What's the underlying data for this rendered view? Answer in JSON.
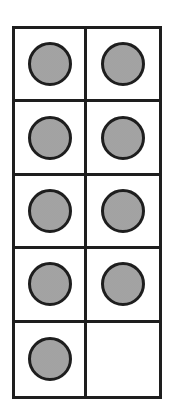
{
  "ten_frame": {
    "columns": 2,
    "rows": 5,
    "filled_count": 9,
    "total_cells": 10,
    "counter_color": "#a9a9a9",
    "line_color": "#1e1e1e",
    "cells": [
      {
        "row": 0,
        "col": 0,
        "filled": true
      },
      {
        "row": 0,
        "col": 1,
        "filled": true
      },
      {
        "row": 1,
        "col": 0,
        "filled": true
      },
      {
        "row": 1,
        "col": 1,
        "filled": true
      },
      {
        "row": 2,
        "col": 0,
        "filled": true
      },
      {
        "row": 2,
        "col": 1,
        "filled": true
      },
      {
        "row": 3,
        "col": 0,
        "filled": true
      },
      {
        "row": 3,
        "col": 1,
        "filled": true
      },
      {
        "row": 4,
        "col": 0,
        "filled": true
      },
      {
        "row": 4,
        "col": 1,
        "filled": false
      }
    ]
  }
}
